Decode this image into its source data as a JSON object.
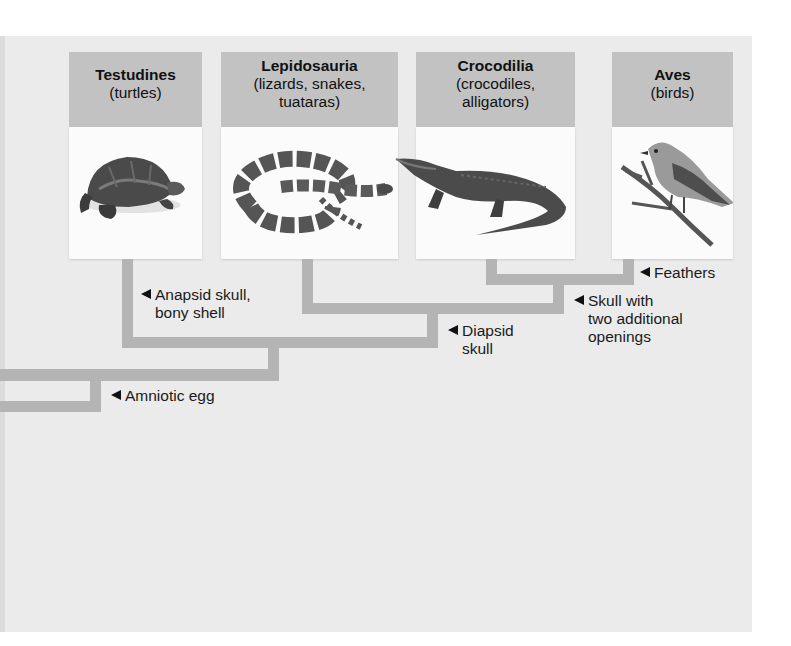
{
  "figure": {
    "colors": {
      "background_panel": "#ebebeb",
      "header_box": "#c2c2c2",
      "image_box": "#fbfbfb",
      "branch": "#b4b4b4",
      "text": "#111111"
    }
  },
  "taxa": [
    {
      "name": "Testudines",
      "common": "(turtles)",
      "image": "turtle-illustration"
    },
    {
      "name": "Lepidosauria",
      "common": "(lizards, snakes, tuataras)",
      "common_lines": [
        "(lizards, snakes,",
        "tuataras)"
      ],
      "image": "snake-illustration"
    },
    {
      "name": "Crocodilia",
      "common": "(crocodiles, alligators)",
      "common_lines": [
        "(crocodiles,",
        "alligators)"
      ],
      "image": "alligator-illustration"
    },
    {
      "name": "Aves",
      "common": "(birds)",
      "image": "bird-illustration"
    }
  ],
  "traits": [
    {
      "label": "Feathers",
      "lines": [
        "Feathers"
      ]
    },
    {
      "label": "Skull with two additional openings",
      "lines": [
        "Skull with",
        "two additional",
        "openings"
      ]
    },
    {
      "label": "Diapsid skull",
      "lines": [
        "Diapsid",
        "skull"
      ]
    },
    {
      "label": "Anapsid skull, bony shell",
      "lines": [
        "Anapsid skull,",
        "bony shell"
      ]
    },
    {
      "label": "Amniotic egg",
      "lines": [
        "Amniotic egg"
      ]
    }
  ],
  "marker_icon": "left-pointing-triangle"
}
